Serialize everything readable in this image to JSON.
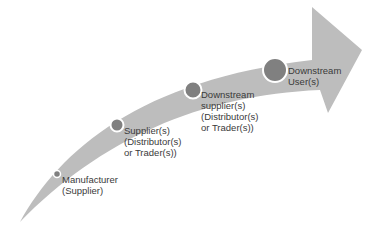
{
  "diagram": {
    "type": "supply-chain-flow-arrow",
    "colors": {
      "arrow": "#bdbdbd",
      "node_fill": "#808080",
      "node_stroke": "#ffffff",
      "text": "#3a3a3a"
    },
    "stages": [
      {
        "id": "manufacturer",
        "lines": [
          "Manufacturer",
          "(Supplier)"
        ]
      },
      {
        "id": "supplier",
        "lines": [
          "Supplier(s)",
          "(Distributor(s)",
          "or Trader(s))"
        ]
      },
      {
        "id": "downstream-supplier",
        "lines": [
          "Downstream",
          "supplier(s)",
          "(Distributor(s)",
          "or Trader(s))"
        ]
      },
      {
        "id": "downstream-user",
        "lines": [
          "Downstream",
          "User(s)"
        ]
      }
    ]
  }
}
